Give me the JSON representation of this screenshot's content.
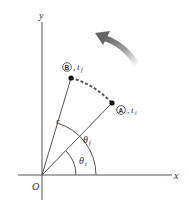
{
  "diagram": {
    "axes": {
      "x_label": "x",
      "y_label": "y",
      "origin_label": "O"
    },
    "points": [
      {
        "id": "A",
        "circle_label": "A",
        "time_label": "t",
        "time_sub": "i"
      },
      {
        "id": "B",
        "circle_label": "B",
        "time_label": "t",
        "time_sub": "f"
      }
    ],
    "radius_label": "r",
    "angles": [
      {
        "symbol": "θ",
        "sub": "i"
      },
      {
        "symbol": "θ",
        "sub": "f"
      }
    ],
    "colors": {
      "line": "#555555",
      "path": "#555555",
      "arrow": "#6e6e6e",
      "text": "#333333"
    }
  }
}
